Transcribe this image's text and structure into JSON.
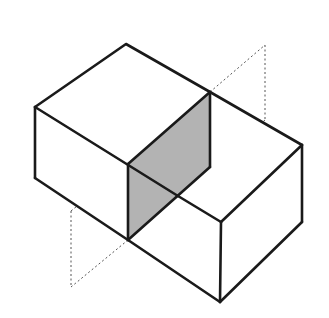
{
  "diagram": {
    "colors": {
      "background": "#ffffff",
      "edge": "#1a1a1a",
      "shaded_section": "#b3b3b3",
      "dashed_plane": "#555555"
    },
    "left_block": {
      "top_face": [
        [
          126,
          44
        ],
        [
          35,
          107
        ],
        [
          128,
          164
        ],
        [
          210,
          92
        ]
      ],
      "front_face": [
        [
          35,
          107
        ],
        [
          128,
          164
        ],
        [
          128,
          240
        ],
        [
          35,
          178
        ]
      ]
    },
    "right_block": {
      "top_face": [
        [
          128,
          164
        ],
        [
          210,
          92
        ],
        [
          302,
          145
        ],
        [
          221,
          222
        ]
      ],
      "front_face": [
        [
          128,
          164
        ],
        [
          221,
          222
        ],
        [
          220,
          302
        ],
        [
          128,
          240
        ]
      ],
      "right_face": [
        [
          221,
          222
        ],
        [
          302,
          145
        ],
        [
          302,
          222
        ],
        [
          220,
          302
        ]
      ]
    },
    "shaded_section": [
      [
        128,
        164
      ],
      [
        210,
        92
      ],
      [
        210,
        167
      ],
      [
        128,
        240
      ]
    ],
    "cutting_plane": [
      [
        71,
        211
      ],
      [
        265,
        45
      ],
      [
        265,
        120
      ],
      [
        71,
        287
      ]
    ]
  }
}
